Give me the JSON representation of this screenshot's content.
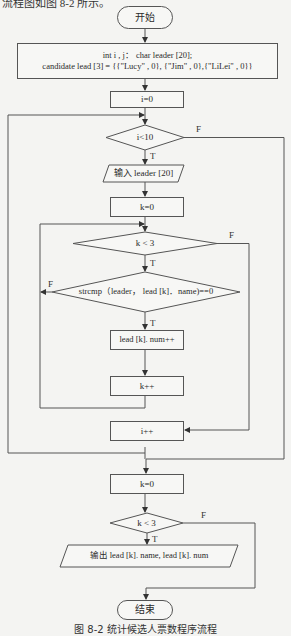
{
  "top_text": "流程图如图 8-2 所示。",
  "caption": "图 8-2   统计候选人票数程序流程",
  "nodes": {
    "start": "开始",
    "decl_line1": "int i , j： char leader [20];",
    "decl_line2": "candidate lead [3] = {{\"Lucy\" , 0}, {\"Jim\" , 0},{\"LiLei\" , 0}}",
    "i_init": "i=0",
    "i_cond": "i<10",
    "input": "输入 leader [20]",
    "k_init": "k=0",
    "k_cond": "k < 3",
    "strcmp_cond": "strcmp（leader， lead [k]．name)==0",
    "num_inc": "lead [k]. num++",
    "k_inc": "k++",
    "i_inc": "i++",
    "k_init2": "k=0",
    "k_cond2": "k < 3",
    "output": "输出 lead [k]. name, lead [k]. num",
    "end": "结束"
  },
  "labels": {
    "true": "T",
    "false": "F"
  }
}
